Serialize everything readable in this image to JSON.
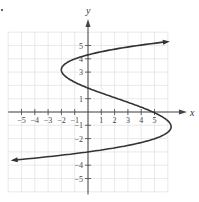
{
  "chart_data": {
    "type": "line",
    "title": "",
    "xlabel": "x",
    "ylabel": "y",
    "xlim": [
      -6,
      6
    ],
    "ylim": [
      -6,
      6
    ],
    "grid": true,
    "x_ticks": [
      -5,
      -4,
      -3,
      -2,
      -1,
      1,
      2,
      3,
      4,
      5
    ],
    "y_ticks": [
      5,
      4,
      3,
      1,
      -1,
      -2,
      -4,
      -5
    ],
    "x_tick_labels": [
      "-5",
      "-4",
      "-3",
      "-2",
      "-1",
      "1",
      "2",
      "3",
      "4",
      "5"
    ],
    "y_tick_labels": [
      "5",
      "4",
      "3",
      "1",
      "-1",
      "-2",
      "-4",
      "-5"
    ],
    "series": [
      {
        "name": "curve",
        "description": "S-shaped cubic curve x as a function of y, arrows at both ends",
        "points": [
          {
            "x": 5.8,
            "y": 5.3
          },
          {
            "x": 0,
            "y": 4.3
          },
          {
            "x": -2,
            "y": 3
          },
          {
            "x": 0,
            "y": 1.8
          },
          {
            "x": 3,
            "y": 1
          },
          {
            "x": 5.5,
            "y": -0.5
          },
          {
            "x": 0,
            "y": -3
          },
          {
            "x": -5.7,
            "y": -3.8
          }
        ]
      }
    ]
  },
  "labels": {
    "x_axis": "x",
    "y_axis": "y"
  },
  "colors": {
    "curve": "#333333",
    "grid": "#e4e4e4",
    "axis": "#444444"
  }
}
